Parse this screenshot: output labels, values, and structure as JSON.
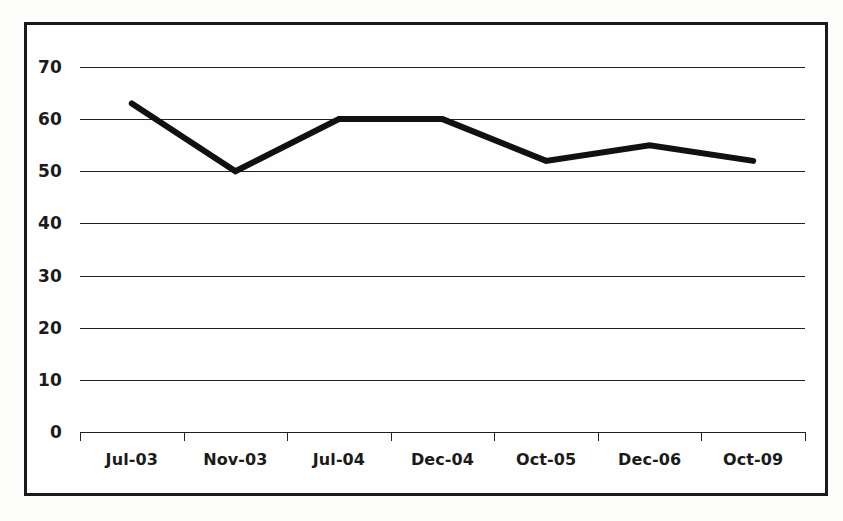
{
  "chart_data": {
    "type": "line",
    "title": "",
    "subtitle": "",
    "xlabel": "",
    "ylabel": "",
    "categories": [
      "Jul-03",
      "Nov-03",
      "Jul-04",
      "Dec-04",
      "Oct-05",
      "Dec-06",
      "Oct-09"
    ],
    "values": [
      63,
      50,
      60,
      60,
      52,
      55,
      52
    ],
    "series": [
      {
        "name": "",
        "values": [
          63,
          50,
          60,
          60,
          52,
          55,
          52
        ]
      }
    ],
    "ylim": [
      0,
      70
    ],
    "yticks": [
      0,
      10,
      20,
      30,
      40,
      50,
      60,
      70
    ],
    "ytick_labels": [
      "0",
      "10",
      "20",
      "30",
      "40",
      "50",
      "60",
      "70"
    ],
    "grid": true,
    "grid_axis": "y",
    "legend": false,
    "legend_position": "none",
    "annotations": [],
    "line_color": "#111111",
    "line_width_px": 6,
    "gridline_color": "#222222",
    "axis_color": "#222222",
    "text_color": "#1b1b1b",
    "background_color": "#fefefe",
    "frame_color": "#1a1a1a",
    "markers": false
  }
}
